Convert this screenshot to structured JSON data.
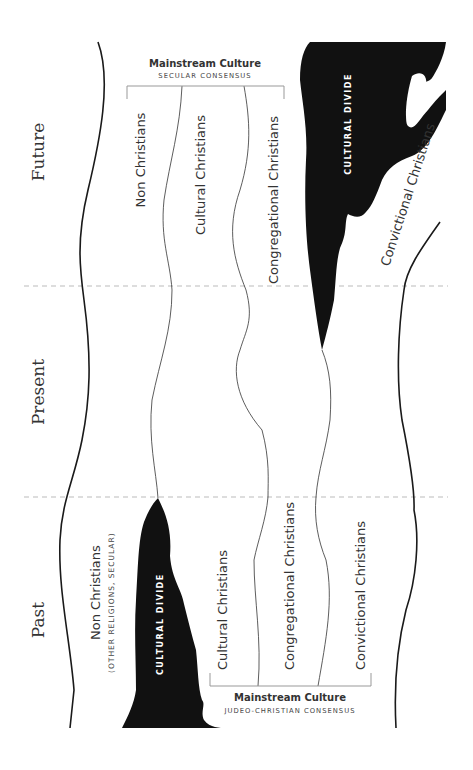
{
  "eras": [
    {
      "label": "Future"
    },
    {
      "label": "Present"
    },
    {
      "label": "Past"
    }
  ],
  "future": {
    "mainstream": {
      "title": "Mainstream Culture",
      "subtitle": "SECULAR CONSENSUS"
    },
    "groups": [
      "Non Christians",
      "Cultural Christians",
      "Congregational Christians"
    ],
    "divide_label": "CULTURAL DIVIDE",
    "outside_group": "Convictional Christians"
  },
  "past": {
    "outside_group": "Non Christians",
    "outside_group_note": "(OTHER RELIGIONS, SECULAR)",
    "divide_label": "CULTURAL DIVIDE",
    "groups": [
      "Cultural Christians",
      "Congregational Christians",
      "Convictional Christians"
    ],
    "mainstream": {
      "title": "Mainstream Culture",
      "subtitle": "JUDEO-CHRISTIAN CONSENSUS"
    }
  },
  "colors": {
    "ink": "#1a1a1a",
    "text": "#333333",
    "divider": "#bbbbbb",
    "bracket": "#999999",
    "divide_fill": "#111111"
  }
}
